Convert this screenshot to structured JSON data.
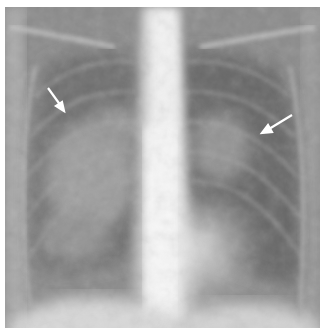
{
  "image": {
    "subject": "chest radiograph (frontal view)",
    "background_color": "#ffffff",
    "annotations": [
      {
        "type": "arrow",
        "color": "#ffffff",
        "side": "right-lung-image-left",
        "from": [
          48,
          88
        ],
        "to": [
          64,
          110
        ]
      },
      {
        "type": "arrow",
        "color": "#ffffff",
        "side": "left-lung-image-right",
        "from": [
          292,
          115
        ],
        "to": [
          262,
          133
        ]
      }
    ]
  }
}
